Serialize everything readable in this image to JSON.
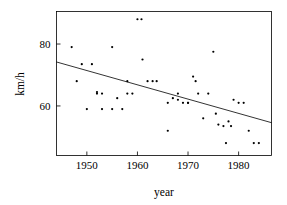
{
  "chart_data": {
    "type": "scatter",
    "title": "",
    "xlabel": "year",
    "ylabel": "km/h",
    "xlim": [
      1944.0,
      1986.5
    ],
    "ylim": [
      44.0,
      90.5
    ],
    "grid": false,
    "legend": null,
    "xticks": [
      1950,
      1960,
      1970,
      1980
    ],
    "xtick_labels": [
      "1950",
      "1960",
      "1970",
      "1980"
    ],
    "yticks": [
      60,
      80
    ],
    "ytick_labels": [
      "60",
      "80"
    ],
    "point_color": "#000000",
    "line_color": "#000000",
    "marker": "dot",
    "series": [
      {
        "name": "observations",
        "x": [
          1947,
          1948,
          1949,
          1950,
          1951,
          1952,
          1952,
          1953,
          1953,
          1955,
          1955,
          1956,
          1957,
          1958,
          1958,
          1959,
          1960,
          1960.8,
          1961,
          1962,
          1963,
          1963.8,
          1966,
          1966,
          1967,
          1968,
          1968,
          1969,
          1970,
          1970,
          1971,
          1971.5,
          1972,
          1973,
          1974,
          1975,
          1975.5,
          1976,
          1977,
          1977.5,
          1978,
          1978.5,
          1979,
          1980,
          1981,
          1982,
          1983,
          1984
        ],
        "y": [
          79,
          68,
          73.5,
          59,
          73.5,
          64,
          64.5,
          59,
          64,
          79,
          59,
          62.5,
          59,
          68,
          64,
          64,
          88,
          88,
          75,
          68,
          68,
          68,
          61,
          52,
          62.5,
          64,
          62,
          61,
          61,
          61,
          69.5,
          68,
          64,
          56,
          64,
          77.5,
          57.5,
          54,
          53.5,
          48,
          55,
          53.5,
          62,
          61,
          61,
          52,
          48,
          48
        ]
      }
    ],
    "trend_line": {
      "name": "least-squares fit",
      "x_start": 1944.0,
      "y_start": 74.2,
      "x_end": 1986.5,
      "y_end": 54.6
    }
  },
  "axes": {
    "y_title": "km/h",
    "x_title": "year"
  }
}
